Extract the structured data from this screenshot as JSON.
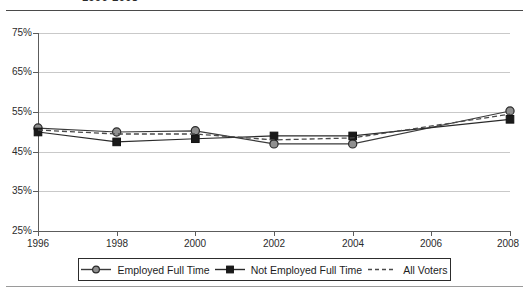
{
  "chart_data": {
    "type": "line",
    "title": "1996-2008",
    "xlabel": "",
    "ylabel": "",
    "x": [
      1996,
      1998,
      2000,
      2002,
      2004,
      2006,
      2008
    ],
    "categories": [
      "1996",
      "1998",
      "2000",
      "2002",
      "2004",
      "2006",
      "2008"
    ],
    "xtick_labels": [
      "1996",
      "1998",
      "2000",
      "2002",
      "2004",
      "2006",
      "2008"
    ],
    "ytick_labels": [
      "75%",
      "65%",
      "55%",
      "45%",
      "35%",
      "25%"
    ],
    "ytick_values": [
      75,
      65,
      55,
      45,
      35,
      25
    ],
    "ylim": [
      25,
      75
    ],
    "xlim": [
      1996,
      2008
    ],
    "grid": "horizontal",
    "legend_position": "bottom",
    "series": [
      {
        "name": "Employed Full Time",
        "marker": "circle",
        "linestyle": "solid",
        "color": "#3b3b3b",
        "marker_fill": "#8f8f8f",
        "x": [
          1996,
          1998,
          2000,
          2002,
          2004,
          2008
        ],
        "values": [
          51.0,
          50.0,
          50.3,
          47.0,
          47.0,
          55.3
        ]
      },
      {
        "name": "Not Employed Full Time",
        "marker": "square",
        "linestyle": "solid",
        "color": "#2a2a2a",
        "marker_fill": "#1a1a1a",
        "x": [
          1996,
          1998,
          2000,
          2002,
          2004,
          2008
        ],
        "values": [
          50.0,
          47.5,
          48.3,
          49.0,
          49.0,
          53.2
        ]
      },
      {
        "name": "All Voters",
        "marker": "none",
        "linestyle": "dashed",
        "color": "#4a4a4a",
        "marker_fill": "none",
        "x": [
          1996,
          1998,
          2000,
          2002,
          2004,
          2008
        ],
        "values": [
          50.5,
          49.5,
          49.5,
          48.0,
          48.5,
          54.5
        ]
      }
    ]
  },
  "legend": {
    "items": [
      {
        "label": "Employed Full Time",
        "marker": "circle-marker"
      },
      {
        "label": "Not Employed Full Time",
        "marker": "square-marker"
      },
      {
        "label": "All Voters",
        "marker": "dashed-line"
      }
    ]
  }
}
